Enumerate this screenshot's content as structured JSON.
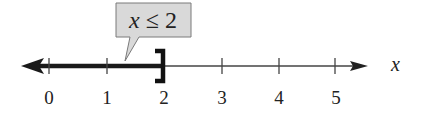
{
  "diagram": {
    "type": "number-line",
    "inequality": {
      "variable": "x",
      "operator": "≤",
      "value": "2",
      "text": "x ≤ 2",
      "endpoint": "closed",
      "endpoint_symbol": "]",
      "direction": "left"
    },
    "axis": {
      "label": "x",
      "ticks": [
        "0",
        "1",
        "2",
        "3",
        "4",
        "5"
      ]
    },
    "colors": {
      "line": "#222222",
      "callout_fill": "#d9d9d9",
      "callout_stroke": "#777777"
    }
  }
}
